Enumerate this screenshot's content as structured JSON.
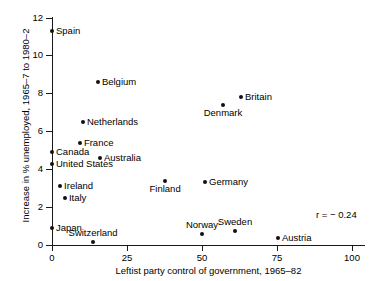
{
  "chart_data": {
    "type": "scatter",
    "title": "",
    "xlabel": "Leftist party control of government, 1965–82",
    "ylabel": "Increase in % unemployed, 1965–7 to 1980–2",
    "xlim": [
      0,
      104
    ],
    "ylim": [
      0,
      12.4
    ],
    "xticks": [
      0,
      25,
      50,
      75,
      100
    ],
    "xtick_labels": [
      "0",
      "25",
      "50",
      "75",
      "100"
    ],
    "yticks": [
      0,
      2,
      4,
      6,
      8,
      10,
      12
    ],
    "ytick_labels": [
      "0",
      "2",
      "4",
      "6",
      "8",
      "10",
      "12"
    ],
    "grid": false,
    "legend": false,
    "annotations": [
      {
        "text": "r = − 0.24",
        "x": 88,
        "y": 1.9
      }
    ],
    "points": [
      {
        "label": "Spain",
        "x": 0.0,
        "y": 11.3,
        "label_pos": "right"
      },
      {
        "label": "Belgium",
        "x": 15.3,
        "y": 8.6,
        "label_pos": "right"
      },
      {
        "label": "Britain",
        "x": 63.0,
        "y": 7.8,
        "label_pos": "right"
      },
      {
        "label": "Denmark",
        "x": 57.0,
        "y": 7.4,
        "label_pos": "below"
      },
      {
        "label": "Netherlands",
        "x": 10.3,
        "y": 6.5,
        "label_pos": "right"
      },
      {
        "label": "France",
        "x": 9.3,
        "y": 5.4,
        "label_pos": "right"
      },
      {
        "label": "Canada",
        "x": 0.0,
        "y": 4.9,
        "label_pos": "right"
      },
      {
        "label": "Australia",
        "x": 16.0,
        "y": 4.6,
        "label_pos": "right"
      },
      {
        "label": "United States",
        "x": 0.0,
        "y": 4.3,
        "label_pos": "right"
      },
      {
        "label": "Finland",
        "x": 37.7,
        "y": 3.4,
        "label_pos": "below"
      },
      {
        "label": "Germany",
        "x": 51.0,
        "y": 3.3,
        "label_pos": "right"
      },
      {
        "label": "Ireland",
        "x": 2.7,
        "y": 3.1,
        "label_pos": "right"
      },
      {
        "label": "Italy",
        "x": 4.3,
        "y": 2.5,
        "label_pos": "right"
      },
      {
        "label": "Japan",
        "x": 0.0,
        "y": 0.9,
        "label_pos": "right"
      },
      {
        "label": "Sweden",
        "x": 61.0,
        "y": 0.75,
        "label_pos": "above"
      },
      {
        "label": "Norway",
        "x": 50.0,
        "y": 0.6,
        "label_pos": "above"
      },
      {
        "label": "Austria",
        "x": 75.3,
        "y": 0.35,
        "label_pos": "right"
      },
      {
        "label": "Switzerland",
        "x": 13.7,
        "y": 0.15,
        "label_pos": "above"
      }
    ]
  }
}
